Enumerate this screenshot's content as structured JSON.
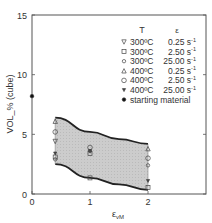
{
  "chart_data": {
    "type": "scatter",
    "title": "",
    "xlabel": "ε_vM",
    "xlabel_main": "ε",
    "xlabel_sub": "vM",
    "ylabel": "VOL_% (cube)",
    "xlim": [
      0,
      3
    ],
    "ylim": [
      0,
      15
    ],
    "xticks": [
      0,
      1,
      2
    ],
    "yticks": [
      0,
      5,
      10,
      15
    ],
    "grid": false,
    "legend_position": "upper right (inside)",
    "legend_header": {
      "T": "T",
      "rate": "ε"
    },
    "series": [
      {
        "name": "300°C 0.25 s-1",
        "T": "300ºC",
        "rate": "0.25 s",
        "marker": "triangle-down",
        "points": [
          [
            0.4,
            4.4
          ]
        ]
      },
      {
        "name": "300°C 2.50 s-1",
        "T": "300ºC",
        "rate": "2.50 s",
        "marker": "square",
        "points": [
          [
            0.4,
            3.1
          ],
          [
            1.0,
            3.4
          ],
          [
            1.0,
            1.35
          ],
          [
            2.0,
            0.55
          ]
        ]
      },
      {
        "name": "300°C 25.00 s-1",
        "T": "300ºC",
        "rate": "25.00 s",
        "marker": "circle-small",
        "points": [
          [
            0.4,
            2.9
          ],
          [
            1.0,
            3.6
          ],
          [
            2.0,
            2.4
          ]
        ]
      },
      {
        "name": "400°C 0.25 s-1",
        "T": "400ºC",
        "rate": "0.25 s",
        "marker": "triangle-up",
        "points": [
          [
            0.4,
            6.1
          ],
          [
            2.0,
            3.8
          ]
        ]
      },
      {
        "name": "400°C 2.50 s-1",
        "T": "400ºC",
        "rate": "2.50 s",
        "marker": "circle",
        "points": [
          [
            0.4,
            5.2
          ],
          [
            1.0,
            3.9
          ],
          [
            2.0,
            3.0
          ]
        ]
      },
      {
        "name": "400°C 25.00 s-1",
        "T": "400ºC",
        "rate": "25.00 s",
        "marker": "triangle-down-filled",
        "points": [
          [
            0.4,
            3.4
          ],
          [
            1.0,
            3.6
          ],
          [
            2.0,
            1.1
          ]
        ]
      },
      {
        "name": "starting material",
        "T": "starting material",
        "rate": "",
        "marker": "dot-filled",
        "points": [
          [
            0.0,
            8.2
          ]
        ]
      }
    ],
    "band": {
      "description": "shaded scatter band between two curves",
      "upper": [
        [
          0.4,
          6.4
        ],
        [
          1.0,
          5.2
        ],
        [
          1.5,
          4.6
        ],
        [
          2.0,
          4.2
        ]
      ],
      "lower": [
        [
          0.4,
          2.5
        ],
        [
          1.0,
          1.35
        ],
        [
          1.5,
          0.8
        ],
        [
          2.0,
          0.35
        ]
      ],
      "fill": "#c8c8c8"
    },
    "rate_superscript": "-1"
  },
  "colors": {
    "axis": "#555555",
    "band_fill": "#cccccc",
    "curve": "#222222",
    "marker": "#444444",
    "text": "#333333"
  }
}
